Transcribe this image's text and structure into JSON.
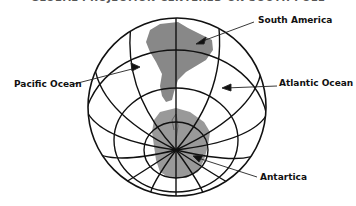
{
  "title": "GLOBAL PROJECTION CENTERED ON SOUTH POLE",
  "labels": {
    "south_america": "South America",
    "pacific_ocean": "Pacific Ocean",
    "atlantic_ocean": "Atlantic Ocean",
    "antarctica": "Antartica"
  },
  "colors": {
    "land": "#888888",
    "lines": "#111111",
    "background": "#ffffff"
  }
}
